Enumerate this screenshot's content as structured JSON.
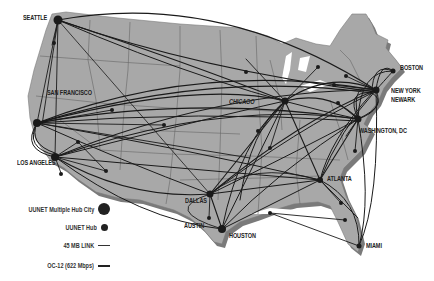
{
  "map": {
    "title": "UUNET Network Map",
    "land_color": "#a8a8a8",
    "border_color": "#666666",
    "link_color": "#1a1a1a",
    "shadow_color": "#7a7a7a"
  },
  "cities": [
    {
      "name": "SEATTLE",
      "x": 58,
      "y": 20,
      "type": "multi"
    },
    {
      "name": "SAN FRANCISCO",
      "x": 37,
      "y": 123,
      "type": "multi"
    },
    {
      "name": "LOS ANGELES",
      "x": 55,
      "y": 157,
      "type": "multi"
    },
    {
      "name": "CHICAGO",
      "x": 285,
      "y": 101,
      "type": "multi"
    },
    {
      "name": "BOSTON",
      "x": 393,
      "y": 71,
      "type": "hub"
    },
    {
      "name": "NEW YORK",
      "x": 376,
      "y": 90,
      "type": "multi"
    },
    {
      "name": "NEWARK",
      "x": 372,
      "y": 93,
      "type": "multi"
    },
    {
      "name": "WASHINGTON, DC",
      "x": 358,
      "y": 119,
      "type": "multi"
    },
    {
      "name": "ATLANTA",
      "x": 320,
      "y": 180,
      "type": "multi"
    },
    {
      "name": "DALLAS",
      "x": 210,
      "y": 194,
      "type": "multi"
    },
    {
      "name": "AUSTIN",
      "x": 209,
      "y": 218,
      "type": "hub"
    },
    {
      "name": "HOUSTON",
      "x": 222,
      "y": 229,
      "type": "multi"
    },
    {
      "name": "MIAMI",
      "x": 359,
      "y": 246,
      "type": "hub"
    }
  ],
  "labels": [
    {
      "text": "SEATTLE",
      "x": 23,
      "y": 18
    },
    {
      "text": "SAN FRANCISCO",
      "x": 47,
      "y": 92
    },
    {
      "text": "LOS ANGELES",
      "x": 18,
      "y": 161
    },
    {
      "text": "CHICAGO",
      "x": 229,
      "y": 98
    },
    {
      "text": "BOSTON",
      "x": 400,
      "y": 65
    },
    {
      "text": "NEW YORK",
      "x": 391,
      "y": 88
    },
    {
      "text": "NEWARK",
      "x": 391,
      "y": 97
    },
    {
      "text": "WASHINGTON, DC",
      "x": 359,
      "y": 128
    },
    {
      "text": "ATLANTA",
      "x": 326,
      "y": 176
    },
    {
      "text": "DALLAS",
      "x": 185,
      "y": 198
    },
    {
      "text": "AUSTIN",
      "x": 184,
      "y": 223
    },
    {
      "text": "HOUSTON",
      "x": 229,
      "y": 234
    },
    {
      "text": "MIAMI",
      "x": 365,
      "y": 243
    }
  ],
  "legend": {
    "items": [
      {
        "label": "UUNET Multiple Hub City",
        "symbol": "large-dot"
      },
      {
        "label": "UUNET Hub",
        "symbol": "small-dot"
      },
      {
        "label": "45 MB LINK",
        "symbol": "thin-line"
      },
      {
        "label": "OC-12 (622 Mbps)",
        "symbol": "thick-line"
      }
    ]
  }
}
